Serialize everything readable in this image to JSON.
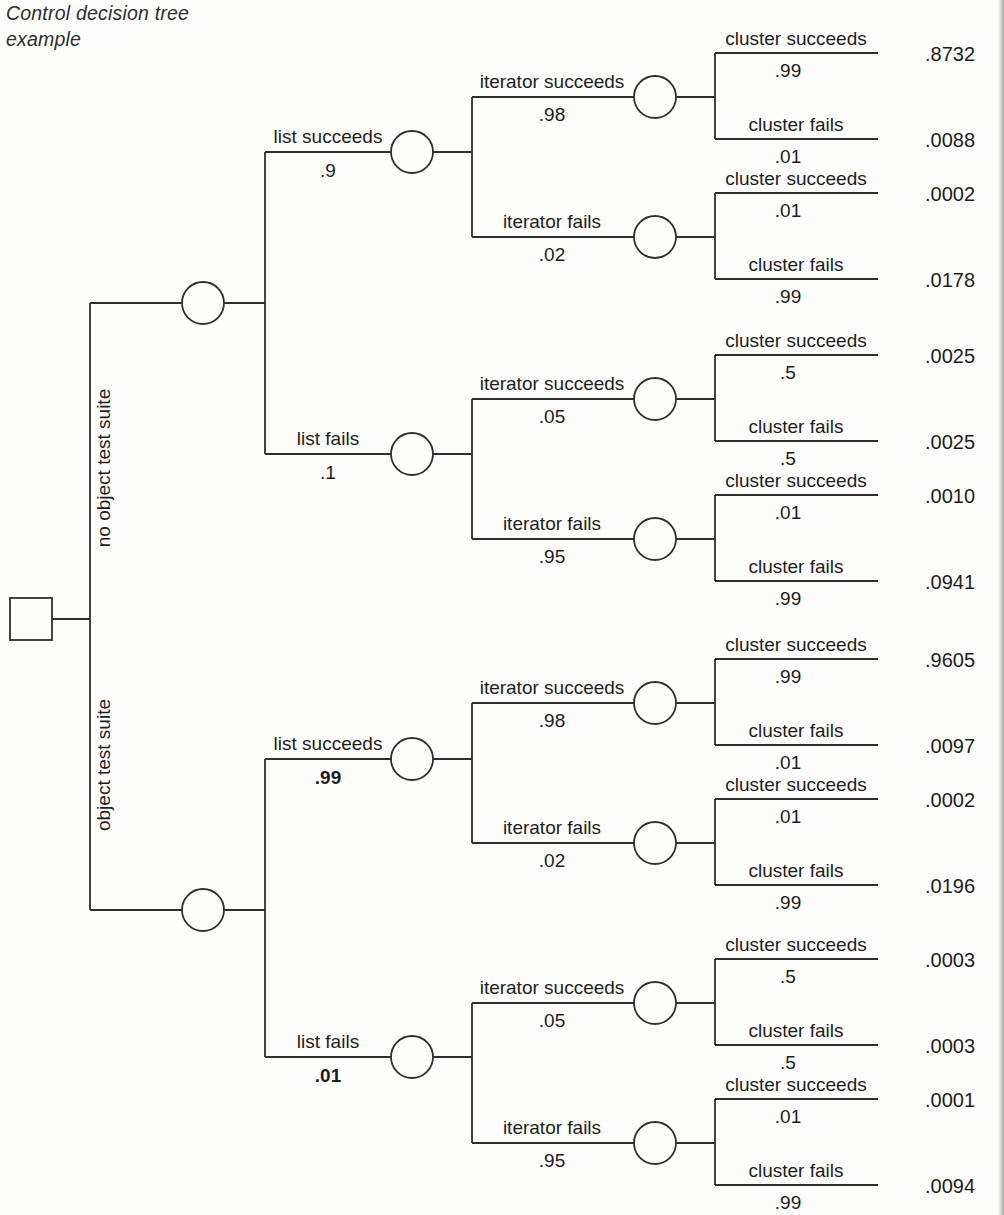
{
  "title": {
    "line1": "Control decision tree",
    "line2": "example"
  },
  "colors": {
    "line": "#2f2f2f",
    "text": "#1d1d1d",
    "paper": "#fdfdfb",
    "edge": "#a8a8a8"
  },
  "tree": {
    "root_type": "decision",
    "branches": [
      {
        "label": "no object test suite",
        "children": [
          {
            "label": "list succeeds",
            "prob": ".9",
            "emphasis": false,
            "children": [
              {
                "label": "iterator succeeds",
                "prob": ".98",
                "children": [
                  {
                    "label": "cluster succeeds",
                    "prob": ".99",
                    "outcome": ".8732"
                  },
                  {
                    "label": "cluster fails",
                    "prob": ".01",
                    "outcome": ".0088"
                  }
                ]
              },
              {
                "label": "iterator fails",
                "prob": ".02",
                "children": [
                  {
                    "label": "cluster succeeds",
                    "prob": ".01",
                    "outcome": ".0002"
                  },
                  {
                    "label": "cluster fails",
                    "prob": ".99",
                    "outcome": ".0178"
                  }
                ]
              }
            ]
          },
          {
            "label": "list fails",
            "prob": ".1",
            "emphasis": false,
            "children": [
              {
                "label": "iterator succeeds",
                "prob": ".05",
                "children": [
                  {
                    "label": "cluster succeeds",
                    "prob": ".5",
                    "outcome": ".0025"
                  },
                  {
                    "label": "cluster fails",
                    "prob": ".5",
                    "outcome": ".0025"
                  }
                ]
              },
              {
                "label": "iterator fails",
                "prob": ".95",
                "children": [
                  {
                    "label": "cluster succeeds",
                    "prob": ".01",
                    "outcome": ".0010"
                  },
                  {
                    "label": "cluster fails",
                    "prob": ".99",
                    "outcome": ".0941"
                  }
                ]
              }
            ]
          }
        ]
      },
      {
        "label": "object test suite",
        "children": [
          {
            "label": "list succeeds",
            "prob": ".99",
            "emphasis": true,
            "children": [
              {
                "label": "iterator succeeds",
                "prob": ".98",
                "children": [
                  {
                    "label": "cluster succeeds",
                    "prob": ".99",
                    "outcome": ".9605"
                  },
                  {
                    "label": "cluster fails",
                    "prob": ".01",
                    "outcome": ".0097"
                  }
                ]
              },
              {
                "label": "iterator fails",
                "prob": ".02",
                "children": [
                  {
                    "label": "cluster succeeds",
                    "prob": ".01",
                    "outcome": ".0002"
                  },
                  {
                    "label": "cluster fails",
                    "prob": ".99",
                    "outcome": ".0196"
                  }
                ]
              }
            ]
          },
          {
            "label": "list fails",
            "prob": ".01",
            "emphasis": true,
            "children": [
              {
                "label": "iterator succeeds",
                "prob": ".05",
                "children": [
                  {
                    "label": "cluster succeeds",
                    "prob": ".5",
                    "outcome": ".0003"
                  },
                  {
                    "label": "cluster fails",
                    "prob": ".5",
                    "outcome": ".0003"
                  }
                ]
              },
              {
                "label": "iterator fails",
                "prob": ".95",
                "children": [
                  {
                    "label": "cluster succeeds",
                    "prob": ".01",
                    "outcome": ".0001"
                  },
                  {
                    "label": "cluster fails",
                    "prob": ".99",
                    "outcome": ".0094"
                  }
                ]
              }
            ]
          }
        ]
      }
    ]
  }
}
